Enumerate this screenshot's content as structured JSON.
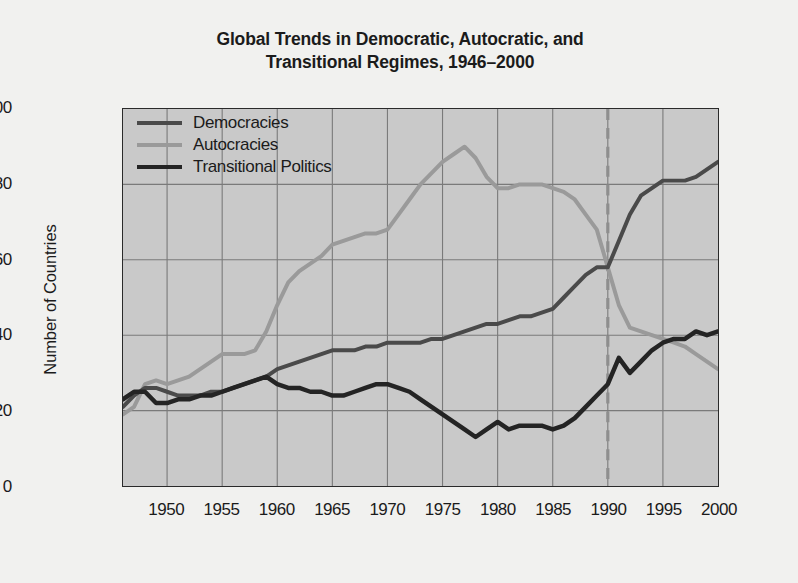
{
  "chart_data": {
    "type": "line",
    "title": "Global Trends in Democratic, Autocratic, and Transitional Regimes, 1946–2000",
    "title_line1": "Global Trends in Democratic, Autocratic, and",
    "title_line2": "Transitional Regimes, 1946–2000",
    "xlabel": "",
    "ylabel": "Number of Countries",
    "xlim": [
      1946,
      2000
    ],
    "ylim": [
      0,
      100
    ],
    "xticks": [
      1950,
      1955,
      1960,
      1965,
      1970,
      1975,
      1980,
      1985,
      1990,
      1995,
      2000
    ],
    "yticks": [
      0,
      20,
      40,
      60,
      80,
      100
    ],
    "xtick_labels": [
      "1950",
      "1955",
      "1960",
      "1965",
      "1970",
      "1975",
      "1980",
      "1985",
      "1990",
      "1995",
      "2000"
    ],
    "ytick_labels": [
      "0",
      "20",
      "40",
      "60",
      "80",
      "100"
    ],
    "grid": true,
    "legend_position": "top-left",
    "plot_background": "#c9c9c9",
    "figure_background": "#f1f1ef",
    "grid_color": "#7a7a7a",
    "axis_color": "#2a2a2a",
    "annotations": [
      {
        "type": "vertical-dashed-line",
        "x": 1990,
        "color": "#8e8e8e",
        "label": "1990"
      }
    ],
    "x": [
      1946,
      1947,
      1948,
      1949,
      1950,
      1951,
      1952,
      1953,
      1954,
      1955,
      1956,
      1957,
      1958,
      1959,
      1960,
      1961,
      1962,
      1963,
      1964,
      1965,
      1966,
      1967,
      1968,
      1969,
      1970,
      1971,
      1972,
      1973,
      1974,
      1975,
      1976,
      1977,
      1978,
      1979,
      1980,
      1981,
      1982,
      1983,
      1984,
      1985,
      1986,
      1987,
      1988,
      1989,
      1990,
      1991,
      1992,
      1993,
      1994,
      1995,
      1996,
      1997,
      1998,
      1999,
      2000
    ],
    "series": [
      {
        "name": "Democracies",
        "color": "#4a4a4a",
        "linewidth": 4,
        "values": [
          21,
          24,
          26,
          26,
          25,
          24,
          24,
          24,
          25,
          25,
          26,
          27,
          28,
          29,
          31,
          32,
          33,
          34,
          35,
          36,
          36,
          36,
          37,
          37,
          38,
          38,
          38,
          38,
          39,
          39,
          40,
          41,
          42,
          43,
          43,
          44,
          45,
          45,
          46,
          47,
          50,
          53,
          56,
          58,
          58,
          65,
          72,
          77,
          79,
          81,
          81,
          81,
          82,
          84,
          86
        ]
      },
      {
        "name": "Autocracies",
        "color": "#9a9a9a",
        "linewidth": 4,
        "values": [
          19,
          21,
          27,
          28,
          27,
          28,
          29,
          31,
          33,
          35,
          35,
          35,
          36,
          41,
          48,
          54,
          57,
          59,
          61,
          64,
          65,
          66,
          67,
          67,
          68,
          72,
          76,
          80,
          83,
          86,
          88,
          90,
          87,
          82,
          79,
          79,
          80,
          80,
          80,
          79,
          78,
          76,
          72,
          68,
          58,
          48,
          42,
          41,
          40,
          39,
          38,
          37,
          35,
          33,
          31
        ]
      },
      {
        "name": "Transitional Politics",
        "color": "#242424",
        "linewidth": 4.5,
        "values": [
          23,
          25,
          25,
          22,
          22,
          23,
          23,
          24,
          24,
          25,
          26,
          27,
          28,
          29,
          27,
          26,
          26,
          25,
          25,
          24,
          24,
          25,
          26,
          27,
          27,
          26,
          25,
          23,
          21,
          19,
          17,
          15,
          13,
          15,
          17,
          15,
          16,
          16,
          16,
          15,
          16,
          18,
          21,
          24,
          27,
          34,
          30,
          33,
          36,
          38,
          39,
          39,
          41,
          40,
          41
        ]
      }
    ]
  },
  "legend": {
    "items": [
      {
        "label": "Democracies",
        "color": "#4a4a4a"
      },
      {
        "label": "Autocracies",
        "color": "#9a9a9a"
      },
      {
        "label": "Transitional Politics",
        "color": "#242424"
      }
    ]
  }
}
